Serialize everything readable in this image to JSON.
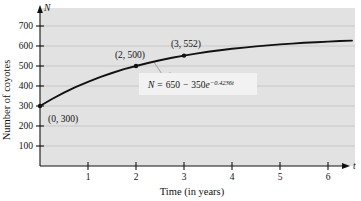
{
  "chart_data": {
    "type": "line",
    "title": "",
    "xlabel": "Time (in years)",
    "ylabel": "Number of coyotes",
    "x_axis_symbol": "t",
    "y_axis_symbol": "N",
    "xlim": [
      0,
      6.6
    ],
    "ylim": [
      0,
      745
    ],
    "xticks": [
      1,
      2,
      3,
      4,
      5,
      6
    ],
    "xtick_labels": [
      "1",
      "2",
      "3",
      "4",
      "5",
      "6"
    ],
    "yticks": [
      100,
      200,
      300,
      400,
      500,
      600,
      700
    ],
    "ytick_labels": [
      "100",
      "200",
      "300",
      "400",
      "500",
      "600",
      "700"
    ],
    "grid": "horizontal",
    "plot_background": "#e2e2e2",
    "curve_color": "#111111",
    "equation": {
      "lhs": "N",
      "equals": "=",
      "rhs_a": "650",
      "minus": "−",
      "rhs_b": "350",
      "base": "e",
      "exponent": "−0.4236t",
      "full": "N = 650 − 350e^(−0.4236t)"
    },
    "annotations": [
      {
        "label": "(0, 300)",
        "x": 0,
        "y": 300
      },
      {
        "label": "(2, 500)",
        "x": 2,
        "y": 500
      },
      {
        "label": "(3, 552)",
        "x": 3,
        "y": 552
      }
    ],
    "series": [
      {
        "name": "Coyote population",
        "x": [
          0,
          0.25,
          0.5,
          0.75,
          1,
          1.25,
          1.5,
          1.75,
          2,
          2.25,
          2.5,
          2.75,
          3,
          3.25,
          3.5,
          3.75,
          4,
          4.25,
          4.5,
          4.75,
          5,
          5.25,
          5.5,
          5.75,
          6,
          6.25,
          6.5
        ],
        "y": [
          300,
          335,
          367,
          396,
          421,
          444,
          465,
          484,
          500,
          515,
          529,
          541,
          552,
          562,
          571,
          579,
          586,
          592,
          598,
          603,
          608,
          612,
          616,
          619,
          622,
          625,
          627
        ]
      }
    ]
  }
}
